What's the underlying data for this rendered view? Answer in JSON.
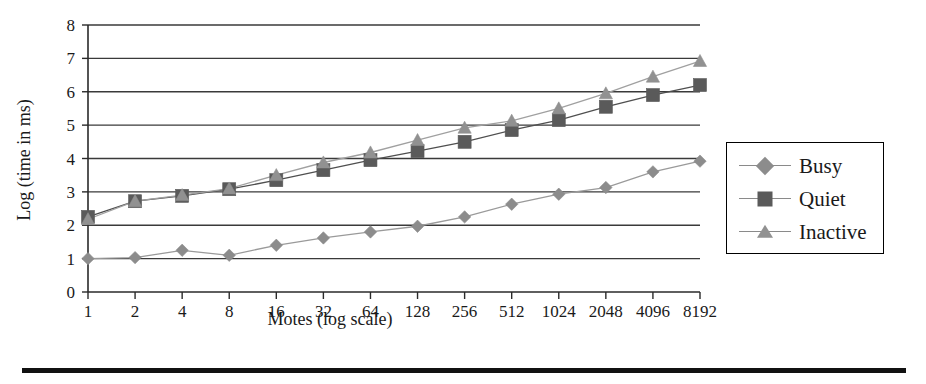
{
  "chart_data": {
    "type": "line",
    "title": "",
    "subtitle": "",
    "xlabel": "Motes (log scale)",
    "ylabel": "Log (time in ms)",
    "x_scale": "log2-categorical",
    "categories": [
      "1",
      "2",
      "4",
      "8",
      "16",
      "32",
      "64",
      "128",
      "256",
      "512",
      "1024",
      "2048",
      "4096",
      "8192"
    ],
    "x_tick_labels": [
      "1",
      "2",
      "4",
      "8",
      "16",
      "32",
      "64",
      "128",
      "256",
      "512",
      "1024",
      "2048",
      "4096",
      "8192"
    ],
    "y_tick_labels": [
      "0",
      "1",
      "2",
      "3",
      "4",
      "5",
      "6",
      "7",
      "8"
    ],
    "ylim": [
      0,
      8
    ],
    "y_ticks": [
      0,
      1,
      2,
      3,
      4,
      5,
      6,
      7,
      8
    ],
    "grid": true,
    "grid_axis": "y",
    "legend_position": "right-outside",
    "series": [
      {
        "name": "Busy",
        "marker": "diamond",
        "color": "#8c8c8c",
        "line_color": "#9a9a9a",
        "values": [
          1.0,
          1.03,
          1.25,
          1.1,
          1.4,
          1.62,
          1.8,
          1.97,
          2.25,
          2.63,
          2.93,
          3.13,
          3.6,
          3.92
        ]
      },
      {
        "name": "Quiet",
        "marker": "square",
        "color": "#5a5a5a",
        "line_color": "#4f4f4f",
        "values": [
          2.25,
          2.72,
          2.88,
          3.08,
          3.35,
          3.65,
          3.95,
          4.22,
          4.5,
          4.85,
          5.15,
          5.55,
          5.9,
          6.2
        ]
      },
      {
        "name": "Inactive",
        "marker": "triangle",
        "color": "#919191",
        "line_color": "#a0a0a0",
        "values": [
          2.18,
          2.72,
          2.9,
          3.1,
          3.5,
          3.88,
          4.18,
          4.55,
          4.92,
          5.13,
          5.5,
          5.95,
          6.45,
          6.92
        ]
      }
    ]
  },
  "legend": {
    "items": [
      {
        "label": "Busy",
        "marker": "diamond"
      },
      {
        "label": "Quiet",
        "marker": "square"
      },
      {
        "label": "Inactive",
        "marker": "triangle"
      }
    ]
  },
  "axes": {
    "x_title": "Motes (log scale)",
    "y_title": "Log (time in ms)"
  }
}
